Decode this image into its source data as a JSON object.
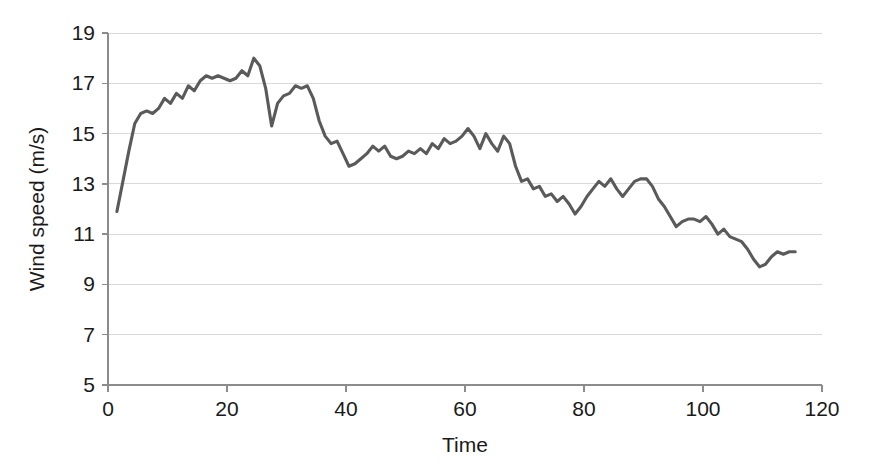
{
  "chart_data": {
    "type": "line",
    "title": "",
    "xlabel": "Time",
    "ylabel": "Wind speed (m/s)",
    "xlim": [
      0,
      120
    ],
    "ylim": [
      5,
      19
    ],
    "xticks": [
      0,
      20,
      40,
      60,
      80,
      100,
      120
    ],
    "yticks": [
      5,
      7,
      9,
      11,
      13,
      15,
      17,
      19
    ],
    "grid": "horizontal",
    "legend": "none",
    "series": [
      {
        "name": "Wind speed",
        "color": "#5a5a5a",
        "x": [
          1.5,
          2.5,
          3.5,
          4.5,
          5.5,
          6.5,
          7.5,
          8.5,
          9.5,
          10.5,
          11.5,
          12.5,
          13.5,
          14.5,
          15.5,
          16.5,
          17.5,
          18.5,
          19.5,
          20.5,
          21.5,
          22.5,
          23.5,
          24.5,
          25.5,
          26.5,
          27.5,
          28.5,
          29.5,
          30.5,
          31.5,
          32.5,
          33.5,
          34.5,
          35.5,
          36.5,
          37.5,
          38.5,
          39.5,
          40.5,
          41.5,
          42.5,
          43.5,
          44.5,
          45.5,
          46.5,
          47.5,
          48.5,
          49.5,
          50.5,
          51.5,
          52.5,
          53.5,
          54.5,
          55.5,
          56.5,
          57.5,
          58.5,
          59.5,
          60.5,
          61.5,
          62.5,
          63.5,
          64.5,
          65.5,
          66.5,
          67.5,
          68.5,
          69.5,
          70.5,
          71.5,
          72.5,
          73.5,
          74.5,
          75.5,
          76.5,
          77.5,
          78.5,
          79.5,
          80.5,
          81.5,
          82.5,
          83.5,
          84.5,
          85.5,
          86.5,
          87.5,
          88.5,
          89.5,
          90.5,
          91.5,
          92.5,
          93.5,
          94.5,
          95.5,
          96.5,
          97.5,
          98.5,
          99.5,
          100.5,
          101.5,
          102.5,
          103.5,
          104.5,
          105.5,
          106.5,
          107.5,
          108.5,
          109.5,
          110.5,
          111.5,
          112.5,
          113.5,
          114.5,
          115.5
        ],
        "y": [
          11.9,
          13.1,
          14.3,
          15.4,
          15.8,
          15.9,
          15.8,
          16.0,
          16.4,
          16.2,
          16.6,
          16.4,
          16.9,
          16.7,
          17.1,
          17.3,
          17.2,
          17.3,
          17.2,
          17.1,
          17.2,
          17.5,
          17.3,
          18.0,
          17.7,
          16.8,
          15.3,
          16.2,
          16.5,
          16.6,
          16.9,
          16.8,
          16.9,
          16.4,
          15.5,
          14.9,
          14.6,
          14.7,
          14.2,
          13.7,
          13.8,
          14.0,
          14.2,
          14.5,
          14.3,
          14.5,
          14.1,
          14.0,
          14.1,
          14.3,
          14.2,
          14.4,
          14.2,
          14.6,
          14.4,
          14.8,
          14.6,
          14.7,
          14.9,
          15.2,
          14.9,
          14.4,
          15.0,
          14.6,
          14.3,
          14.9,
          14.6,
          13.7,
          13.1,
          13.2,
          12.8,
          12.9,
          12.5,
          12.6,
          12.3,
          12.5,
          12.2,
          11.8,
          12.1,
          12.5,
          12.8,
          13.1,
          12.9,
          13.2,
          12.8,
          12.5,
          12.8,
          13.1,
          13.2,
          13.2,
          12.9,
          12.4,
          12.1,
          11.7,
          11.3,
          11.5,
          11.6,
          11.6,
          11.5,
          11.7,
          11.4,
          11.0,
          11.2,
          10.9,
          10.8,
          10.7,
          10.4,
          10.0,
          9.7,
          9.8,
          10.1,
          10.3,
          10.2,
          10.3,
          10.3
        ]
      }
    ]
  },
  "axes": {
    "x_tick_labels": [
      "0",
      "20",
      "40",
      "60",
      "80",
      "100",
      "120"
    ],
    "y_tick_labels": [
      "5",
      "7",
      "9",
      "11",
      "13",
      "15",
      "17",
      "19"
    ],
    "x_title": "Time",
    "y_title": "Wind speed (m/s)"
  },
  "style": {
    "line_color": "#5a5a5a",
    "grid_color": "#d9d9d9",
    "axis_color": "#8c8c8c",
    "text_color": "#1a1a1a",
    "background": "#ffffff"
  }
}
